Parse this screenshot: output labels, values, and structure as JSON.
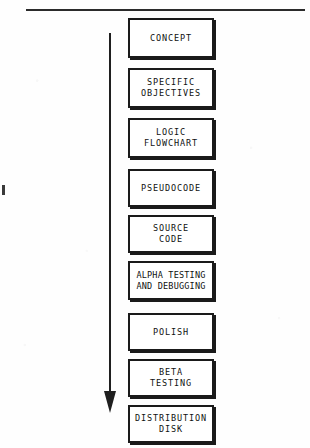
{
  "diagram": {
    "orientation": "vertical-top-to-bottom",
    "ink_color": "#1a1a1a",
    "background_color": "#fefefe",
    "top_rule": {
      "name": "horizontal-rule",
      "x": 26,
      "y": 9,
      "width": 279
    },
    "margin_tick": {
      "name": "margin-registration-tick",
      "x": 2,
      "y": 185
    },
    "arrow": {
      "name": "downward-flow-arrow",
      "direction": "down",
      "x": 110,
      "y_start": 33,
      "y_end": 415
    },
    "nodes": [
      {
        "id": "concept",
        "label": "CONCEPT",
        "x": 128,
        "y": 18,
        "w": 86,
        "h": 40,
        "tight": false
      },
      {
        "id": "objectives",
        "label": "SPECIFIC\nOBJECTIVES",
        "x": 128,
        "y": 68,
        "w": 86,
        "h": 40,
        "tight": false
      },
      {
        "id": "flowchart",
        "label": "LOGIC\nFLOWCHART",
        "x": 128,
        "y": 118,
        "w": 86,
        "h": 40,
        "tight": false
      },
      {
        "id": "pseudocode",
        "label": "PSEUDOCODE",
        "x": 128,
        "y": 169,
        "w": 86,
        "h": 38,
        "tight": false
      },
      {
        "id": "source-code",
        "label": "SOURCE\nCODE",
        "x": 128,
        "y": 215,
        "w": 86,
        "h": 38,
        "tight": false
      },
      {
        "id": "alpha-test",
        "label": "ALPHA TESTING\nAND DEBUGGING",
        "x": 128,
        "y": 261,
        "w": 86,
        "h": 39,
        "tight": true
      },
      {
        "id": "polish",
        "label": "POLISH",
        "x": 128,
        "y": 313,
        "w": 86,
        "h": 38,
        "tight": false
      },
      {
        "id": "beta-test",
        "label": "BETA\nTESTING",
        "x": 128,
        "y": 359,
        "w": 86,
        "h": 38,
        "tight": false
      },
      {
        "id": "distribution",
        "label": "DISTRIBUTION\nDISK",
        "x": 128,
        "y": 405,
        "w": 86,
        "h": 38,
        "tight": false
      }
    ]
  }
}
